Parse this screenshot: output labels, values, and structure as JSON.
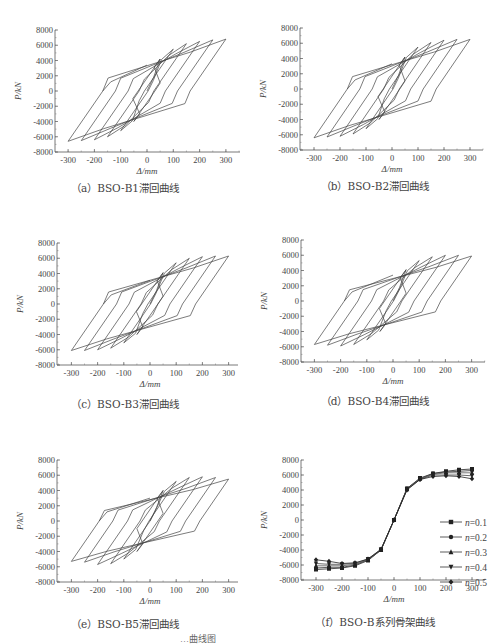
{
  "figure": {
    "caption_fragment": "…曲线图"
  },
  "panels": [
    {
      "id": "a",
      "caption": "（a）BSO-B1滞回曲线",
      "peak": 6700,
      "neg_peak": -6500,
      "tail": 3400
    },
    {
      "id": "b",
      "caption": "（b）BSO-B2滞回曲线",
      "peak": 6500,
      "neg_peak": -6300,
      "tail": 3300
    },
    {
      "id": "c",
      "caption": "（c）BSO-B3滞回曲线",
      "peak": 6300,
      "neg_peak": -6100,
      "tail": 3100
    },
    {
      "id": "d",
      "caption": "（d）BSO-B4滞回曲线",
      "peak": 6000,
      "neg_peak": -5800,
      "tail": 3400
    },
    {
      "id": "e",
      "caption": "（e）BSO-B5滞回曲线",
      "peak": 5700,
      "neg_peak": -5400,
      "tail": 3000
    },
    {
      "id": "f",
      "caption": "（f）BSO-B系列骨架曲线"
    }
  ],
  "axes": {
    "xlabel": "Δ/mm",
    "ylabel": "P/kN",
    "xticks": [
      -300,
      -200,
      -100,
      0,
      100,
      200,
      300
    ],
    "yticks": [
      8000,
      6000,
      4000,
      2000,
      0,
      -2000,
      -4000,
      -6000,
      -8000
    ]
  },
  "chart_data": [
    {
      "type": "line",
      "title": "(a) BSO-B1 hysteresis curve",
      "xlabel": "Δ/mm",
      "ylabel": "P/kN",
      "xlim": [
        -350,
        350
      ],
      "ylim": [
        -8000,
        8000
      ],
      "series": [
        {
          "name": "hysteresis",
          "peak_positive": [
            [
              50,
              4200
            ],
            [
              100,
              5500
            ],
            [
              150,
              6200
            ],
            [
              200,
              6500
            ],
            [
              250,
              6700
            ],
            [
              300,
              6800
            ]
          ],
          "peak_negative": [
            [
              -50,
              -4000
            ],
            [
              -100,
              -5200
            ],
            [
              -150,
              -6000
            ],
            [
              -200,
              -6400
            ],
            [
              -250,
              -6500
            ],
            [
              -300,
              -6600
            ]
          ]
        }
      ]
    },
    {
      "type": "line",
      "title": "(b) BSO-B2 hysteresis curve",
      "xlabel": "Δ/mm",
      "ylabel": "P/kN",
      "xlim": [
        -350,
        350
      ],
      "ylim": [
        -8000,
        8000
      ],
      "series": [
        {
          "name": "hysteresis",
          "peak_positive": [
            [
              50,
              4200
            ],
            [
              100,
              5500
            ],
            [
              150,
              6100
            ],
            [
              200,
              6400
            ],
            [
              250,
              6500
            ],
            [
              300,
              6500
            ]
          ],
          "peak_negative": [
            [
              -50,
              -4000
            ],
            [
              -100,
              -5200
            ],
            [
              -150,
              -5900
            ],
            [
              -200,
              -6200
            ],
            [
              -250,
              -6300
            ],
            [
              -300,
              -6400
            ]
          ]
        }
      ]
    },
    {
      "type": "line",
      "title": "(c) BSO-B3 hysteresis curve",
      "xlabel": "Δ/mm",
      "ylabel": "P/kN",
      "xlim": [
        -350,
        350
      ],
      "ylim": [
        -8000,
        8000
      ],
      "series": [
        {
          "name": "hysteresis",
          "peak_positive": [
            [
              50,
              4100
            ],
            [
              100,
              5400
            ],
            [
              150,
              6000
            ],
            [
              200,
              6200
            ],
            [
              250,
              6300
            ],
            [
              300,
              6300
            ]
          ],
          "peak_negative": [
            [
              -50,
              -4000
            ],
            [
              -100,
              -5100
            ],
            [
              -150,
              -5800
            ],
            [
              -200,
              -6000
            ],
            [
              -250,
              -6100
            ],
            [
              -300,
              -6100
            ]
          ]
        }
      ]
    },
    {
      "type": "line",
      "title": "(d) BSO-B4 hysteresis curve",
      "xlabel": "Δ/mm",
      "ylabel": "P/kN",
      "xlim": [
        -350,
        350
      ],
      "ylim": [
        -8000,
        8000
      ],
      "series": [
        {
          "name": "hysteresis",
          "peak_positive": [
            [
              50,
              4100
            ],
            [
              100,
              5300
            ],
            [
              150,
              5800
            ],
            [
              200,
              6000
            ],
            [
              250,
              6000
            ],
            [
              300,
              5900
            ]
          ],
          "peak_negative": [
            [
              -50,
              -4000
            ],
            [
              -100,
              -5100
            ],
            [
              -150,
              -5700
            ],
            [
              -200,
              -5900
            ],
            [
              -250,
              -5800
            ],
            [
              -300,
              -5700
            ]
          ]
        }
      ]
    },
    {
      "type": "line",
      "title": "(e) BSO-B5 hysteresis curve",
      "xlabel": "Δ/mm",
      "ylabel": "P/kN",
      "xlim": [
        -350,
        350
      ],
      "ylim": [
        -8000,
        8000
      ],
      "series": [
        {
          "name": "hysteresis",
          "peak_positive": [
            [
              50,
              4000
            ],
            [
              100,
              5200
            ],
            [
              150,
              5700
            ],
            [
              200,
              5800
            ],
            [
              250,
              5700
            ],
            [
              300,
              5500
            ]
          ],
          "peak_negative": [
            [
              -50,
              -4000
            ],
            [
              -100,
              -5000
            ],
            [
              -150,
              -5600
            ],
            [
              -200,
              -5700
            ],
            [
              -250,
              -5400
            ],
            [
              -300,
              -5300
            ]
          ]
        }
      ]
    },
    {
      "type": "line",
      "title": "(f) BSO-B series skeleton curves",
      "xlabel": "Δ/mm",
      "ylabel": "P/kN",
      "xlim": [
        -350,
        350
      ],
      "ylim": [
        -8000,
        8000
      ],
      "legend_position": "lower right",
      "x": [
        -300,
        -250,
        -200,
        -150,
        -100,
        -50,
        0,
        50,
        100,
        150,
        200,
        250,
        300
      ],
      "series": [
        {
          "name": "n=0.1",
          "marker": "square",
          "values": [
            -6600,
            -6500,
            -6400,
            -6100,
            -5400,
            -4000,
            0,
            4200,
            5600,
            6200,
            6500,
            6700,
            6800
          ]
        },
        {
          "name": "n=0.2",
          "marker": "circle",
          "values": [
            -6400,
            -6300,
            -6300,
            -6000,
            -5300,
            -4000,
            0,
            4200,
            5500,
            6200,
            6400,
            6500,
            6600
          ]
        },
        {
          "name": "n=0.3",
          "marker": "triangle-up",
          "values": [
            -6100,
            -6100,
            -6100,
            -5900,
            -5300,
            -4000,
            0,
            4100,
            5500,
            6100,
            6300,
            6300,
            6300
          ]
        },
        {
          "name": "n=0.4",
          "marker": "triangle-down",
          "values": [
            -5800,
            -5900,
            -5900,
            -5800,
            -5200,
            -3900,
            0,
            4100,
            5400,
            6000,
            6000,
            6000,
            5900
          ]
        },
        {
          "name": "n=0.5",
          "marker": "diamond",
          "values": [
            -5300,
            -5500,
            -5800,
            -5700,
            -5200,
            -3900,
            0,
            4000,
            5400,
            5800,
            5900,
            5800,
            5500
          ]
        }
      ]
    }
  ]
}
